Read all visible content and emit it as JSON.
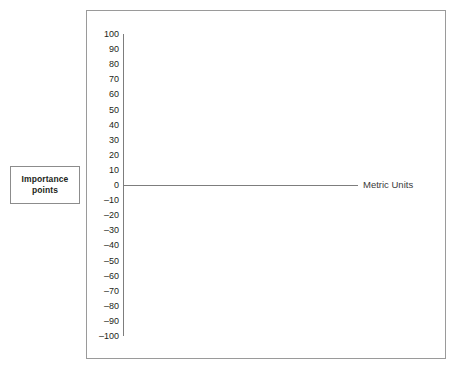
{
  "caption_box": {
    "lines": [
      "Importance",
      "points"
    ]
  },
  "axis_title": "Metric Units",
  "colors": {
    "axis_line": "#7d7d7d",
    "frame_border": "#9a9a9a",
    "box_border": "#8c8c8c",
    "text": "#231f20",
    "background": "#ffffff"
  },
  "chart_data": {
    "type": "line",
    "title": "",
    "xlabel": "Metric Units",
    "ylabel": "Importance points",
    "ylim": [
      -100,
      100
    ],
    "yticks": [
      100,
      90,
      80,
      70,
      60,
      50,
      40,
      30,
      20,
      10,
      0,
      -10,
      -20,
      -30,
      -40,
      -50,
      -60,
      -70,
      -80,
      -90,
      -100
    ],
    "ytick_labels": [
      "100",
      "90",
      "80",
      "70",
      "60",
      "50",
      "40",
      "30",
      "20",
      "10",
      "0",
      "–10",
      "–20",
      "–30",
      "–40",
      "–50",
      "–60",
      "–70",
      "–80",
      "–90",
      "–100"
    ],
    "xticks": [],
    "xtick_labels": [],
    "grid": false,
    "legend": false,
    "series": [
      {
        "name": "zero baseline",
        "values": [
          0,
          0
        ],
        "note": "Horizontal reference line drawn at y = 0 across the plot; no data plotted."
      }
    ]
  }
}
